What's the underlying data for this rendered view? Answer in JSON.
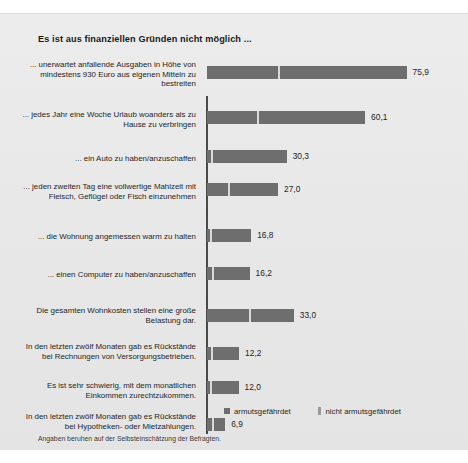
{
  "chart_data": {
    "type": "bar",
    "orientation": "horizontal",
    "stacked": true,
    "title": "Es ist aus finanziellen Gründen nicht möglich ...",
    "xlabel": "",
    "ylabel": "",
    "xlim": [
      0,
      100
    ],
    "grid": false,
    "legend_position": "bottom-right",
    "categories": [
      "... unerwartet anfallende Ausgaben in Höhe von mindestens 930 Euro aus eigenen Mitteln zu bestreiten",
      "... jedes Jahr eine Woche Urlaub woanders als zu Hause zu verbringen",
      "... ein Auto zu haben/anzuschaffen",
      "... jeden zweiten Tag eine vollwertige Mahlzeit mit Fleisch, Geflügel oder Fisch einzunehmen",
      "... die Wohnung angemessen warm zu halten",
      "... einen Computer zu haben/anzuschaffen",
      "Die gesamten Wohnkosten stellen eine große Belastung dar.",
      "In den letzten zwölf Monaten gab es Rückstände bei Rechnungen von Versorgungsbetrieben.",
      "Es ist sehr schwierig, mit dem monatlichen Einkommen zurechtzukommen.",
      "In den letzten zwölf Monaten gab es Rückstände bei Hypotheken- oder Mietzahlungen."
    ],
    "series": [
      {
        "name": "armutsgefährdet",
        "color": "#6e6e6e",
        "values": [
          27.0,
          19.0,
          1.5,
          8.0,
          1.2,
          2.0,
          16.0,
          1.5,
          1.2,
          2.0
        ]
      },
      {
        "name": "nicht armutsgefährdet",
        "color": "#6e6e6e",
        "values": [
          48.9,
          41.1,
          28.8,
          19.0,
          15.6,
          14.2,
          17.0,
          10.7,
          10.8,
          4.9
        ]
      }
    ],
    "totals": [
      75.9,
      60.1,
      30.3,
      27.0,
      16.8,
      16.2,
      33.0,
      12.2,
      12.0,
      6.9
    ],
    "value_labels": [
      "75,9",
      "60,1",
      "30,3",
      "27,0",
      "16,8",
      "16,2",
      "33,0",
      "12,2",
      "12,0",
      "6,9"
    ]
  },
  "legend": {
    "items": [
      {
        "label": "armutsgefährdet"
      },
      {
        "label": "nicht armutsgefährdet"
      }
    ]
  },
  "footnote": "Angaben beruhen auf der Selbsteinschätzung der Befragten."
}
